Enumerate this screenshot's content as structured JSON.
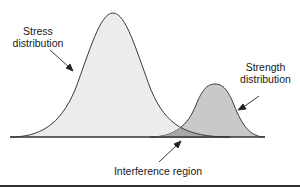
{
  "diagram": {
    "labels": {
      "stress": [
        "Stress",
        "distribution"
      ],
      "strength": [
        "Strength",
        "distribution"
      ],
      "interference": "Interference region"
    },
    "colors": {
      "stress_fill": "#ececec",
      "strength_fill": "#c9c9c9",
      "overlap_fill": "#a8a8a8",
      "outline": "#3a3a3a"
    },
    "curves": {
      "stress": {
        "mean_x": 113,
        "peak_y": 13,
        "sigma_px": 32
      },
      "strength": {
        "mean_x": 215,
        "peak_y": 84,
        "sigma_px": 16
      },
      "baseline_y": 137
    }
  }
}
